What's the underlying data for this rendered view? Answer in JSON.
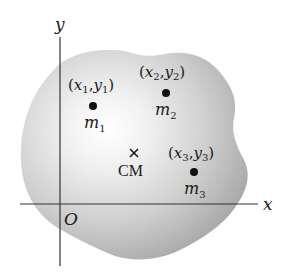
{
  "diagram": {
    "axes": {
      "x_label": "x",
      "y_label": "y",
      "origin_label": "O"
    },
    "masses": [
      {
        "mass_label": "m",
        "mass_sub": "1",
        "coord_x": "x",
        "coord_x_sub": "1",
        "coord_y": "y",
        "coord_y_sub": "1"
      },
      {
        "mass_label": "m",
        "mass_sub": "2",
        "coord_x": "x",
        "coord_x_sub": "2",
        "coord_y": "y",
        "coord_y_sub": "2"
      },
      {
        "mass_label": "m",
        "mass_sub": "3",
        "coord_x": "x",
        "coord_x_sub": "3",
        "coord_y": "y",
        "coord_y_sub": "3"
      }
    ],
    "center_of_mass": {
      "marker": "×",
      "label": "CM"
    },
    "colors": {
      "body_edge": "#9a9a9a",
      "body_center": "#ffffff",
      "axis": "#333333",
      "point": "#111111"
    }
  }
}
